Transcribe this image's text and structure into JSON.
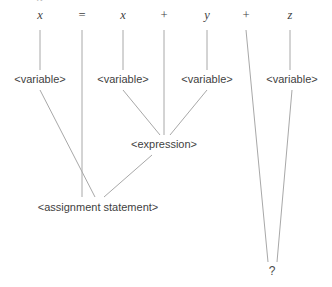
{
  "diagram": {
    "type": "parse-tree",
    "canvas": {
      "width": 332,
      "height": 287,
      "background": "#ffffff"
    },
    "edge_color": "#a8a8a8",
    "text_color": "#3f3f3f",
    "tokens": [
      {
        "id": "tok-x1",
        "label": "x",
        "x": 40,
        "y": 15
      },
      {
        "id": "tok-eq",
        "label": "=",
        "x": 82,
        "y": 15
      },
      {
        "id": "tok-x2",
        "label": "x",
        "x": 123,
        "y": 15
      },
      {
        "id": "tok-plus1",
        "label": "+",
        "x": 164,
        "y": 15
      },
      {
        "id": "tok-y",
        "label": "y",
        "x": 207,
        "y": 15
      },
      {
        "id": "tok-plus2",
        "label": "+",
        "x": 246,
        "y": 15
      },
      {
        "id": "tok-z",
        "label": "z",
        "x": 290,
        "y": 15
      }
    ],
    "top_crop_marks": [
      {
        "id": "crop-1",
        "label": "x",
        "x": 40
      },
      {
        "id": "crop-2",
        "label": "=",
        "x": 82
      }
    ],
    "nonterminals": [
      {
        "id": "var-1",
        "label": "<variable>",
        "x": 40,
        "y": 79
      },
      {
        "id": "var-2",
        "label": "<variable>",
        "x": 123,
        "y": 79
      },
      {
        "id": "var-3",
        "label": "<variable>",
        "x": 207,
        "y": 79
      },
      {
        "id": "var-4",
        "label": "<variable>",
        "x": 292,
        "y": 79
      },
      {
        "id": "expression",
        "label": "<expression>",
        "x": 164,
        "y": 144
      },
      {
        "id": "assignment",
        "label": "<assignment statement>",
        "x": 98,
        "y": 207
      }
    ],
    "unknown_node": {
      "id": "unknown",
      "label": "?",
      "x": 272,
      "y": 271
    },
    "edges": [
      {
        "id": "e-x1-var1",
        "from": "tok-x1",
        "to": "var-1",
        "x1": 40,
        "y1": 30,
        "x2": 40,
        "y2": 70
      },
      {
        "id": "e-eq-stem",
        "from": "tok-eq",
        "to": "assignment",
        "x1": 82,
        "y1": 30,
        "x2": 82,
        "y2": 70
      },
      {
        "id": "e-x2-var2",
        "from": "tok-x2",
        "to": "var-2",
        "x1": 123,
        "y1": 30,
        "x2": 123,
        "y2": 70
      },
      {
        "id": "e-plus1",
        "from": "tok-plus1",
        "to": "expression",
        "x1": 164,
        "y1": 30,
        "x2": 164,
        "y2": 70
      },
      {
        "id": "e-y-var3",
        "from": "tok-y",
        "to": "var-3",
        "x1": 207,
        "y1": 30,
        "x2": 207,
        "y2": 70
      },
      {
        "id": "e-plus2",
        "from": "tok-plus2",
        "to": "unknown",
        "x1": 246,
        "y1": 30,
        "x2": 268,
        "y2": 262
      },
      {
        "id": "e-z-var4",
        "from": "tok-z",
        "to": "var-4",
        "x1": 290,
        "y1": 30,
        "x2": 290,
        "y2": 70
      },
      {
        "id": "e-var1-asg",
        "from": "var-1",
        "to": "assignment",
        "x1": 40,
        "y1": 90,
        "x2": 95,
        "y2": 197
      },
      {
        "id": "e-eq-asg",
        "from": "tok-eq",
        "to": "assignment",
        "x1": 82,
        "y1": 70,
        "x2": 82,
        "y2": 197
      },
      {
        "id": "e-var2-exp",
        "from": "var-2",
        "to": "expression",
        "x1": 123,
        "y1": 90,
        "x2": 160,
        "y2": 135
      },
      {
        "id": "e-plus1-exp",
        "from": "tok-plus1",
        "to": "expression",
        "x1": 164,
        "y1": 70,
        "x2": 164,
        "y2": 135
      },
      {
        "id": "e-var3-exp",
        "from": "var-3",
        "to": "expression",
        "x1": 207,
        "y1": 90,
        "x2": 170,
        "y2": 135
      },
      {
        "id": "e-exp-asg",
        "from": "expression",
        "to": "assignment",
        "x1": 152,
        "y1": 155,
        "x2": 104,
        "y2": 197
      },
      {
        "id": "e-var4-unk",
        "from": "var-4",
        "to": "unknown",
        "x1": 292,
        "y1": 90,
        "x2": 277,
        "y2": 262
      }
    ]
  }
}
